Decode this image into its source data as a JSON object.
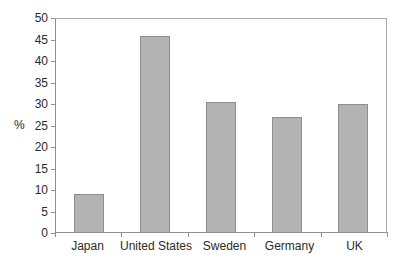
{
  "chart_data": {
    "type": "bar",
    "title": "",
    "categories": [
      "Japan",
      "United States",
      "Sweden",
      "Germany",
      "UK"
    ],
    "values": [
      9,
      46,
      30.5,
      27,
      30
    ],
    "xlabel": "",
    "ylabel": "%",
    "ylim": [
      0,
      50
    ],
    "yticks": [
      0,
      5,
      10,
      15,
      20,
      25,
      30,
      35,
      40,
      45,
      50
    ],
    "grid": false,
    "legend": false,
    "colors": {
      "bar_fill": "#b3b3b3",
      "bar_border": "#8e8e8e",
      "axis": "#8f8f8f",
      "frame": "#a9a9a9",
      "text": "#2b2b2b",
      "background": "#ffffff"
    }
  }
}
